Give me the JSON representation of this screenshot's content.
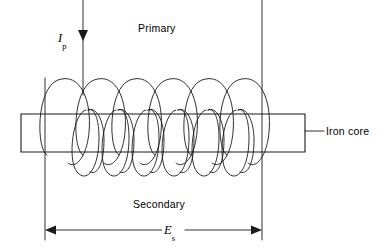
{
  "figure": {
    "type": "schematic-diagram",
    "background_color": "#ffffff",
    "line_color": "#1a1a1a"
  },
  "labels": {
    "primary": "Primary",
    "iron_core": "Iron core",
    "secondary": "Secondary"
  },
  "symbols": {
    "primary_current": {
      "base": "I",
      "subscript": "p"
    },
    "secondary_emf": {
      "base": "E",
      "subscript": "s"
    }
  },
  "geometry": {
    "core": {
      "x": 21,
      "y": 114,
      "width": 284,
      "height": 38
    },
    "primary_lead": {
      "x": 83,
      "y_top": 0,
      "y_arrow": 38
    },
    "secondary_leads": {
      "left_x": 45,
      "right_x": 262,
      "y_top": 0,
      "y_bottom": 232
    },
    "dimension_line": {
      "y": 230,
      "x_start": 45,
      "x_end": 262
    },
    "iron_core_leader": {
      "x_start": 305,
      "x_end": 323,
      "y": 131
    },
    "primary_turns": 6,
    "secondary_turns": 6
  }
}
